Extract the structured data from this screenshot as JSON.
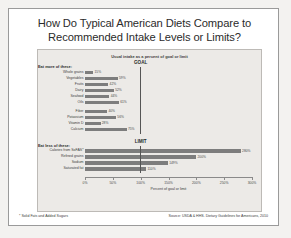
{
  "slide": {
    "title_line1": "How Do Typical American Diets Compare to",
    "title_line2": "Recommended Intake Levels or Limits?",
    "footnote": "* Solid Fats and Added Sugars",
    "source": "Source: USDA & HHS. Dietary Guidelines for Americans, 2010"
  },
  "chart_data": {
    "type": "bar",
    "orientation": "horizontal",
    "title": "Usual intake as a percent of goal or limit",
    "xlabel": "Percent of goal or limit",
    "ylabel": "",
    "xlim": [
      0,
      300
    ],
    "xticks": [
      0,
      50,
      100,
      150,
      200,
      250,
      300
    ],
    "xticklabels": [
      "0%",
      "50%",
      "100%",
      "150%",
      "200%",
      "250%",
      "300%"
    ],
    "grid": false,
    "reference_lines": [
      {
        "label": "GOAL",
        "value": 100
      },
      {
        "label": "LIMIT",
        "value": 100
      }
    ],
    "groups": [
      {
        "heading": "Eat more of these:",
        "categories": [
          "Whole grains",
          "Vegetables",
          "Fruits",
          "Dairy",
          "Seafood",
          "Oils",
          "Fiber",
          "Potassium",
          "Vitamin D",
          "Calcium"
        ],
        "values": [
          15,
          59,
          42,
          52,
          44,
          61,
          40,
          56,
          28,
          75
        ],
        "value_labels": [
          "15%",
          "59%",
          "42%",
          "52%",
          "44%",
          "61%",
          "40%",
          "56%",
          "28%",
          "75%"
        ]
      },
      {
        "heading": "Eat less of these:",
        "categories": [
          "Calories from SoFAS*",
          "Refined grains",
          "Sodium",
          "Saturated fat"
        ],
        "values": [
          280,
          200,
          149,
          110
        ],
        "value_labels": [
          "280%",
          "200%",
          "149%",
          "110%"
        ]
      }
    ],
    "bar_color": "#7d7d7d"
  }
}
